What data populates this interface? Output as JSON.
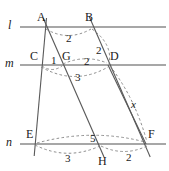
{
  "figure": {
    "stroke_color": "#555555",
    "parallel_line_color": "#8a8a8a",
    "dash_color": "#777777",
    "text_color": "#1a1a1a",
    "width": 169,
    "height": 171
  },
  "parallel_lines": [
    {
      "name": "l",
      "label": "l",
      "y": 27,
      "x1": 20,
      "x2": 166
    },
    {
      "name": "m",
      "label": "m",
      "y": 65,
      "x1": 20,
      "x2": 166
    },
    {
      "name": "n",
      "label": "n",
      "y": 144,
      "x1": 20,
      "x2": 166
    }
  ],
  "points": [
    {
      "name": "A",
      "label": "A",
      "x": 45,
      "y": 27
    },
    {
      "name": "B",
      "label": "B",
      "x": 92,
      "y": 27
    },
    {
      "name": "C",
      "label": "C",
      "x": 42,
      "y": 65
    },
    {
      "name": "G",
      "label": "G",
      "x": 62,
      "y": 65
    },
    {
      "name": "D",
      "label": "D",
      "x": 108,
      "y": 65
    },
    {
      "name": "E",
      "label": "E",
      "x": 36,
      "y": 144
    },
    {
      "name": "H",
      "label": "H",
      "x": 100,
      "y": 144
    },
    {
      "name": "F",
      "label": "F",
      "x": 146,
      "y": 144
    }
  ],
  "transversals": [
    {
      "name": "A-C-E",
      "from": "A",
      "through": "C",
      "to": "E"
    },
    {
      "name": "A-G-H",
      "from": "A",
      "through": "G",
      "to": "H"
    },
    {
      "name": "B-D-F",
      "from": "B",
      "through": "D",
      "to": "F"
    }
  ],
  "measures": [
    {
      "name": "measure-AB",
      "label": "2",
      "x": 66,
      "y": 33,
      "italic": false
    },
    {
      "name": "measure-BD",
      "label": "2",
      "x": 96,
      "y": 45,
      "italic": false
    },
    {
      "name": "measure-CG",
      "label": "1",
      "x": 51,
      "y": 55,
      "italic": false
    },
    {
      "name": "measure-GD",
      "label": "2",
      "x": 84,
      "y": 56,
      "italic": false
    },
    {
      "name": "measure-CD",
      "label": "3",
      "x": 75,
      "y": 72,
      "italic": false
    },
    {
      "name": "measure-DF",
      "label": "x",
      "x": 131,
      "y": 99,
      "italic": true
    },
    {
      "name": "measure-EF",
      "label": "5",
      "x": 90,
      "y": 133,
      "italic": false
    },
    {
      "name": "measure-EH",
      "label": "3",
      "x": 65,
      "y": 153,
      "italic": false
    },
    {
      "name": "measure-HF",
      "label": "2",
      "x": 126,
      "y": 152,
      "italic": false
    }
  ],
  "point_labels": [
    {
      "name": "point-label-A",
      "label": "A",
      "x": 37,
      "y": 11
    },
    {
      "name": "point-label-B",
      "label": "B",
      "x": 85,
      "y": 11
    },
    {
      "name": "point-label-C",
      "label": "C",
      "x": 30,
      "y": 50
    },
    {
      "name": "point-label-G",
      "label": "G",
      "x": 62,
      "y": 50
    },
    {
      "name": "point-label-D",
      "label": "D",
      "x": 110,
      "y": 50
    },
    {
      "name": "point-label-E",
      "label": "E",
      "x": 26,
      "y": 128
    },
    {
      "name": "point-label-H",
      "label": "H",
      "x": 98,
      "y": 155
    },
    {
      "name": "point-label-F",
      "label": "F",
      "x": 148,
      "y": 128
    }
  ],
  "line_labels": [
    {
      "name": "line-label-l",
      "label": "l",
      "x": 8,
      "y": 19
    },
    {
      "name": "line-label-m",
      "label": "m",
      "x": 5,
      "y": 57
    },
    {
      "name": "line-label-n",
      "label": "n",
      "x": 6,
      "y": 136
    }
  ]
}
